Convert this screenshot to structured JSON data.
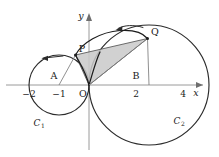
{
  "figure": {
    "background_color": "#ffffff",
    "width": 219,
    "height": 157
  },
  "axes": {
    "x_label": "x",
    "y_label": "y",
    "origin_label": "O",
    "x_ticks": [
      {
        "label": "−2",
        "value": -2
      },
      {
        "label": "−1",
        "value": -1
      },
      {
        "label": "2",
        "value": 2
      },
      {
        "label": "4",
        "value": 4
      }
    ]
  },
  "points": [
    {
      "name": "A",
      "label": "A",
      "x": -1,
      "y": 0
    },
    {
      "name": "B",
      "label": "B",
      "x": 2,
      "y": 0
    },
    {
      "name": "O",
      "label": "O",
      "x": 0,
      "y": 0
    },
    {
      "name": "P",
      "label": "P",
      "x": -0.45,
      "y": 1.0
    },
    {
      "name": "Q",
      "label": "Q",
      "x": 1.95,
      "y": 1.55
    }
  ],
  "circles": [
    {
      "name": "C1",
      "label": "C",
      "subscript": "1",
      "center_x": -1,
      "center_y": 0,
      "radius": 1,
      "center_point": "A"
    },
    {
      "name": "C2",
      "label": "C",
      "subscript": "2",
      "center_x": 2,
      "center_y": 0,
      "radius": 2,
      "center_point": "B"
    }
  ],
  "shaded_region": {
    "name": "triangle-OPQ",
    "vertices": [
      "O",
      "P",
      "Q"
    ],
    "fill_color": "#c9c9c9"
  },
  "arrows": [
    {
      "name": "arrow-P",
      "direction": "counterclockwise",
      "near_point": "P"
    },
    {
      "name": "arrow-Q",
      "direction": "counterclockwise",
      "near_point": "Q"
    }
  ],
  "colors": {
    "stroke": "#1c1c1c",
    "axis": "#9a9a9a",
    "shade": "#c9c9c9",
    "radius": "#7c7c7c"
  }
}
